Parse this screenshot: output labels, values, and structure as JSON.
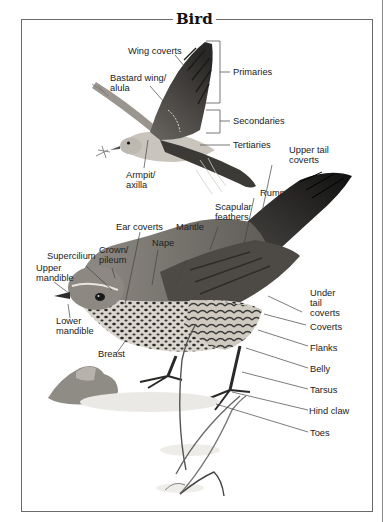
{
  "title": "Bird",
  "flying_bird_labels": {
    "wing_coverts": "Wing coverts",
    "bastard_wing": "Bastard wing/\nalula",
    "primaries": "Primaries",
    "secondaries": "Secondaries",
    "tertiaries": "Tertiaries",
    "armpit": "Armpit/\naxilla"
  },
  "perched_bird_labels": {
    "upper_tail_coverts": "Upper tail\ncoverts",
    "rump": "Rump",
    "scapular_feathers": "Scapular\nfeathers",
    "mantle": "Mantle",
    "ear_coverts": "Ear coverts",
    "nape": "Nape",
    "supercilium": "Supercilium",
    "crown": "Crown/\npileum",
    "upper_mandible": "Upper\nmandible",
    "lower_mandible": "Lower\nmandible",
    "breast": "Breast",
    "under_tail_coverts": "Under\ntail\ncoverts",
    "coverts": "Coverts",
    "flanks": "Flanks",
    "belly": "Belly",
    "tarsus": "Tarsus",
    "hind_claw": "Hind claw",
    "toes": "Toes"
  }
}
